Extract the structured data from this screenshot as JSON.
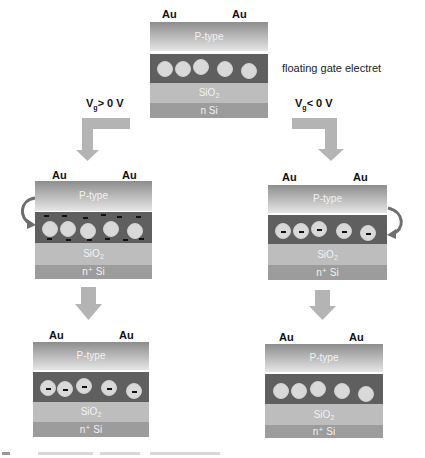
{
  "diagram": {
    "title_annotation": "floating gate electret",
    "colors": {
      "arrow": "#b4b4b4",
      "ptype_top": "#8d8d8d",
      "ptype_bottom": "#e6e6e6",
      "gate_layer": "#5f5f5f",
      "sio2_layer": "#bdbdbd",
      "si_layer": "#9c9c9c",
      "particle": "#d9d9d9",
      "charge": "#111111"
    },
    "bias_labels": {
      "positive": {
        "prefix": "V",
        "sub": "g",
        "suffix": "> 0 V"
      },
      "negative": {
        "prefix": "V",
        "sub": "g",
        "suffix": "< 0 V"
      }
    },
    "devices": [
      {
        "id": "initial",
        "electrodes": [
          "Au",
          "Au"
        ],
        "layers": {
          "top": "P-type",
          "oxide_main": "SiO",
          "oxide_sub": "2",
          "substrate": "n Si"
        },
        "particles": 5,
        "particle_charge": "none",
        "interface_charges": false
      },
      {
        "id": "positive-bias-programming",
        "electrodes": [
          "Au",
          "Au"
        ],
        "layers": {
          "top": "P-type",
          "oxide_main": "SiO",
          "oxide_sub": "2",
          "substrate": "n⁺ Si"
        },
        "particles": 5,
        "particle_charge": "none",
        "interface_charges": true,
        "curved_arrow": "left"
      },
      {
        "id": "negative-bias-programming",
        "electrodes": [
          "Au",
          "Au"
        ],
        "layers": {
          "top": "P-type",
          "oxide_main": "SiO",
          "oxide_sub": "2",
          "substrate": "n⁺ Si"
        },
        "particles": 5,
        "particle_charge": "negative",
        "interface_charges": false,
        "curved_arrow": "right"
      },
      {
        "id": "positive-bias-result",
        "electrodes": [
          "Au",
          "Au"
        ],
        "layers": {
          "top": "P-type",
          "oxide_main": "SiO",
          "oxide_sub": "2",
          "substrate": "n⁺ Si"
        },
        "particles": 5,
        "particle_charge": "negative",
        "interface_charges": false
      },
      {
        "id": "negative-bias-result",
        "electrodes": [
          "Au",
          "Au"
        ],
        "layers": {
          "top": "P-type",
          "oxide_main": "SiO",
          "oxide_sub": "2",
          "substrate": "n⁺ Si"
        },
        "particles": 5,
        "particle_charge": "none",
        "interface_charges": false
      }
    ]
  }
}
